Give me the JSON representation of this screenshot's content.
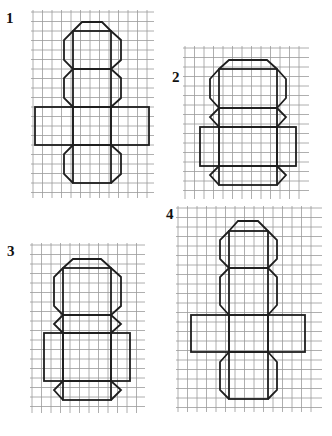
{
  "colors": {
    "grid": "#9a9a9a",
    "outline": "#1e1e1e",
    "label": "#111111",
    "background": "#ffffff"
  },
  "figures": [
    {
      "label": "1",
      "label_pos": [
        6,
        11
      ],
      "grid": {
        "x0": 33,
        "y0": 12,
        "x1": 152,
        "y1": 196,
        "step": 9.5
      },
      "polylines": [
        [
          [
            73,
            31
          ],
          [
            64,
            40
          ],
          [
            64,
            60
          ],
          [
            73,
            69
          ],
          [
            64,
            78
          ],
          [
            64,
            98
          ],
          [
            73,
            107
          ]
        ],
        [
          [
            111,
            31
          ],
          [
            121,
            40
          ],
          [
            121,
            60
          ],
          [
            111,
            69
          ],
          [
            121,
            78
          ],
          [
            121,
            98
          ],
          [
            111,
            107
          ]
        ],
        [
          [
            73,
            31
          ],
          [
            82,
            22
          ],
          [
            102,
            22
          ],
          [
            111,
            31
          ]
        ],
        [
          [
            73,
            145
          ],
          [
            64,
            154
          ],
          [
            64,
            174
          ],
          [
            73,
            183
          ]
        ],
        [
          [
            111,
            145
          ],
          [
            121,
            154
          ],
          [
            121,
            174
          ],
          [
            111,
            183
          ]
        ]
      ],
      "rects": [
        [
          73,
          31,
          38,
          38
        ],
        [
          73,
          69,
          38,
          38
        ],
        [
          35,
          107,
          38,
          38
        ],
        [
          73,
          107,
          38,
          38
        ],
        [
          111,
          107,
          38,
          38
        ],
        [
          73,
          145,
          38,
          38
        ]
      ]
    },
    {
      "label": "2",
      "label_pos": [
        172,
        70
      ],
      "grid": {
        "x0": 185,
        "y0": 48,
        "x1": 307,
        "y1": 197,
        "step": 9.5
      },
      "polylines": [
        [
          [
            219,
            69
          ],
          [
            229,
            60
          ],
          [
            267,
            60
          ],
          [
            277,
            69
          ]
        ],
        [
          [
            219,
            69
          ],
          [
            210,
            79
          ],
          [
            210,
            98
          ],
          [
            219,
            108
          ]
        ],
        [
          [
            277,
            69
          ],
          [
            286,
            79
          ],
          [
            286,
            98
          ],
          [
            277,
            108
          ]
        ],
        [
          [
            219,
            108
          ],
          [
            210,
            117
          ],
          [
            219,
            127
          ]
        ],
        [
          [
            277,
            108
          ],
          [
            286,
            117
          ],
          [
            277,
            127
          ]
        ],
        [
          [
            219,
            166
          ],
          [
            210,
            175
          ],
          [
            219,
            185
          ]
        ],
        [
          [
            277,
            166
          ],
          [
            286,
            175
          ],
          [
            277,
            185
          ]
        ]
      ],
      "rects": [
        [
          219,
          69,
          58,
          39
        ],
        [
          219,
          108,
          58,
          19
        ],
        [
          200,
          127,
          19,
          39
        ],
        [
          219,
          127,
          58,
          39
        ],
        [
          277,
          127,
          19,
          39
        ],
        [
          219,
          166,
          58,
          19
        ]
      ]
    },
    {
      "label": "3",
      "label_pos": [
        7,
        244
      ],
      "grid": {
        "x0": 32,
        "y0": 245,
        "x1": 143,
        "y1": 411,
        "step": 9.5
      },
      "polylines": [
        [
          [
            63,
            268
          ],
          [
            73,
            259
          ],
          [
            101,
            259
          ],
          [
            111,
            268
          ]
        ],
        [
          [
            63,
            268
          ],
          [
            54,
            277
          ],
          [
            54,
            306
          ],
          [
            63,
            315
          ]
        ],
        [
          [
            111,
            268
          ],
          [
            121,
            277
          ],
          [
            121,
            306
          ],
          [
            111,
            315
          ]
        ],
        [
          [
            63,
            315
          ],
          [
            54,
            324
          ],
          [
            63,
            333
          ]
        ],
        [
          [
            111,
            315
          ],
          [
            121,
            324
          ],
          [
            111,
            333
          ]
        ],
        [
          [
            63,
            381
          ],
          [
            54,
            390
          ],
          [
            63,
            400
          ]
        ],
        [
          [
            111,
            381
          ],
          [
            121,
            390
          ],
          [
            111,
            400
          ]
        ]
      ],
      "rects": [
        [
          63,
          268,
          48,
          47
        ],
        [
          63,
          315,
          48,
          18
        ],
        [
          44,
          333,
          19,
          48
        ],
        [
          63,
          333,
          48,
          48
        ],
        [
          111,
          333,
          19,
          48
        ],
        [
          63,
          381,
          48,
          19
        ]
      ]
    },
    {
      "label": "4",
      "label_pos": [
        166,
        207
      ],
      "grid": {
        "x0": 178,
        "y0": 208,
        "x1": 320,
        "y1": 410,
        "step": 9.5
      },
      "polylines": [
        [
          [
            229,
            231
          ],
          [
            238,
            221
          ],
          [
            258,
            221
          ],
          [
            268,
            231
          ]
        ],
        [
          [
            229,
            231
          ],
          [
            220,
            240
          ],
          [
            220,
            259
          ],
          [
            229,
            268
          ],
          [
            220,
            277
          ],
          [
            220,
            305
          ],
          [
            229,
            315
          ]
        ],
        [
          [
            268,
            231
          ],
          [
            277,
            240
          ],
          [
            277,
            259
          ],
          [
            268,
            268
          ],
          [
            277,
            277
          ],
          [
            277,
            305
          ],
          [
            268,
            315
          ]
        ],
        [
          [
            229,
            352
          ],
          [
            220,
            362
          ],
          [
            220,
            390
          ],
          [
            229,
            399
          ]
        ],
        [
          [
            268,
            352
          ],
          [
            277,
            362
          ],
          [
            277,
            390
          ],
          [
            268,
            399
          ]
        ]
      ],
      "rects": [
        [
          229,
          231,
          39,
          37
        ],
        [
          229,
          268,
          39,
          47
        ],
        [
          191,
          315,
          38,
          37
        ],
        [
          229,
          315,
          39,
          37
        ],
        [
          268,
          315,
          37,
          37
        ],
        [
          229,
          352,
          39,
          47
        ]
      ]
    }
  ]
}
